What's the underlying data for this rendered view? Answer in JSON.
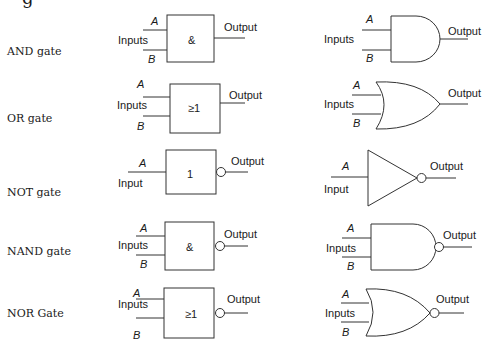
{
  "partial_heading_glyph": "g",
  "rows": [
    {
      "name": "AND gate",
      "iec_symbol": "&",
      "inputs_label": "Inputs",
      "input_a": "A",
      "input_b": "B",
      "output_label": "Output",
      "inverted": false
    },
    {
      "name": "OR gate",
      "iec_symbol": "≥1",
      "inputs_label": "Inputs",
      "input_a": "A",
      "input_b": "B",
      "output_label": "Output",
      "inverted": false
    },
    {
      "name": "NOT gate",
      "iec_symbol": "1",
      "inputs_label": "Input",
      "input_a": "A",
      "output_label": "Output",
      "inverted": true
    },
    {
      "name": "NAND gate",
      "iec_symbol": "&",
      "inputs_label": "Inputs",
      "input_a": "A",
      "input_b": "B",
      "output_label": "Output",
      "inverted": true
    },
    {
      "name": "NOR Gate",
      "iec_symbol": "≥1",
      "inputs_label": "Inputs",
      "input_a": "A",
      "input_b": "B",
      "output_label": "Output",
      "inverted": true
    }
  ]
}
